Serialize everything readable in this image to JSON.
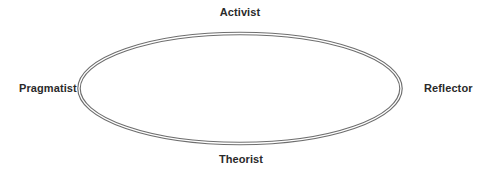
{
  "diagram": {
    "type": "cycle",
    "shape": "double-line ellipse",
    "stroke_color": "#6e6e6e",
    "labels": {
      "top": "Activist",
      "right": "Reflector",
      "bottom": "Theorist",
      "left": "Pragmatist"
    },
    "order_clockwise_from_top": [
      "Activist",
      "Reflector",
      "Theorist",
      "Pragmatist"
    ]
  }
}
